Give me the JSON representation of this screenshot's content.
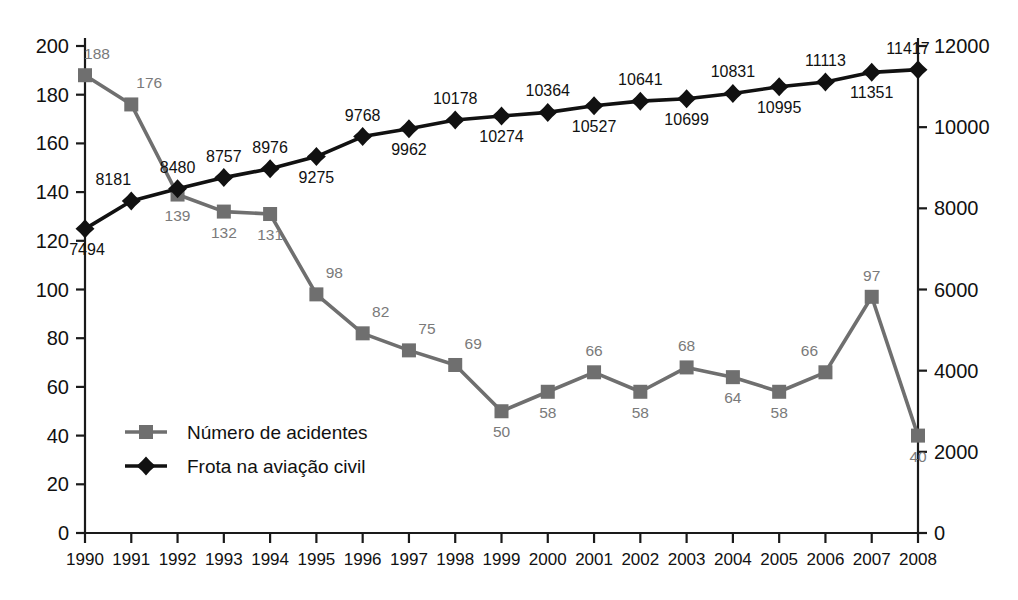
{
  "chart_data": {
    "type": "line",
    "title": "",
    "xlabel": "",
    "ylabel": "",
    "grid": false,
    "legend_position": "inside-bottom-left",
    "categories": [
      "1990",
      "1991",
      "1992",
      "1993",
      "1994",
      "1995",
      "1996",
      "1997",
      "1998",
      "1999",
      "2000",
      "2001",
      "2002",
      "2003",
      "2004",
      "2005",
      "2006",
      "2007",
      "2008"
    ],
    "axes": {
      "x": {
        "ticklabels": [
          "1990",
          "1991",
          "1992",
          "1993",
          "1994",
          "1995",
          "1996",
          "1997",
          "1998",
          "1999",
          "2000",
          "2001",
          "2002",
          "2003",
          "2004",
          "2005",
          "2006",
          "2007",
          "2008"
        ]
      },
      "y_left": {
        "label": "",
        "lim": [
          0,
          200
        ],
        "step": 20,
        "ticklabels": [
          "0",
          "20",
          "40",
          "60",
          "80",
          "100",
          "120",
          "140",
          "160",
          "180",
          "200"
        ]
      },
      "y_right": {
        "label": "",
        "lim": [
          0,
          12000
        ],
        "step": 2000,
        "ticklabels": [
          "0",
          "2000",
          "4000",
          "6000",
          "8000",
          "10000",
          "12000"
        ]
      }
    },
    "series": [
      {
        "name": "Número de acidentes",
        "axis": "left",
        "color": "#6f6f6f",
        "marker": "square",
        "values": [
          188,
          176,
          139,
          132,
          131,
          98,
          82,
          75,
          69,
          50,
          58,
          66,
          58,
          68,
          64,
          58,
          66,
          97,
          40
        ],
        "labels": [
          "188",
          "176",
          "139",
          "132",
          "131",
          "98",
          "82",
          "75",
          "69",
          "50",
          "58",
          "66",
          "58",
          "68",
          "64",
          "58",
          "66",
          "97",
          "40"
        ]
      },
      {
        "name": "Frota na aviação civil",
        "axis": "right",
        "color": "#111111",
        "marker": "diamond",
        "values": [
          7494,
          8181,
          8480,
          8757,
          8976,
          9275,
          9768,
          9962,
          10178,
          10274,
          10364,
          10527,
          10641,
          10699,
          10831,
          10995,
          11113,
          11351,
          11417
        ],
        "labels": [
          "7494",
          "8181",
          "8480",
          "8757",
          "8976",
          "9275",
          "9768",
          "9962",
          "10178",
          "10274",
          "10364",
          "10527",
          "10641",
          "10699",
          "10831",
          "10995",
          "11113",
          "11351",
          "11417"
        ]
      }
    ],
    "legend": [
      {
        "label": "Número de acidentes",
        "color": "#6f6f6f",
        "marker": "square"
      },
      {
        "label": "Frota na aviação civil",
        "color": "#111111",
        "marker": "diamond"
      }
    ]
  }
}
